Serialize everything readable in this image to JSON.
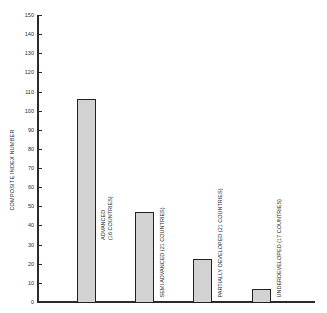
{
  "chart_data": {
    "type": "bar",
    "title": "",
    "xlabel": "",
    "ylabel": "COMPOSITE INDEX NUMBER",
    "ylim": [
      0,
      150
    ],
    "yticks": [
      0,
      10,
      20,
      30,
      40,
      50,
      60,
      70,
      80,
      90,
      100,
      110,
      120,
      130,
      140,
      150
    ],
    "grid": false,
    "legend": null,
    "categories": [
      "ADVANCED (16 COUNTRIES)",
      "SEMI ADVANCED (21 COUNTRIES)",
      "PARTIALLY DEVELOPED (21 COUNTRIES)",
      "UNDERDEVELOPED (17 COUNTRIES)"
    ],
    "values": [
      106,
      47,
      22.5,
      7
    ],
    "bar_labels": [
      [
        "ADVANCED",
        "(16 COUNTRIES)"
      ],
      [
        "SEMI ADVANCED (21 COUNTRIES)"
      ],
      [
        "PARTIALLY DEVELOPED (21 COUNTRIES)"
      ],
      [
        "UNDERDEVELOPED (17 COUNTRIES)"
      ]
    ],
    "bar_fill": "#d2d2d2",
    "bar_edge": "#222222"
  }
}
